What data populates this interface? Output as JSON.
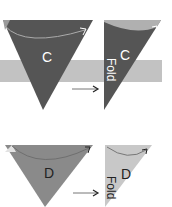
{
  "diagram": {
    "step_c": {
      "label": "C",
      "fold_label": "Fold",
      "colors": {
        "dark": "#555555",
        "band": "#c2c2c2",
        "flap": "#aaaaaa",
        "text": "#ffffff"
      }
    },
    "step_d": {
      "label": "D",
      "fold_label": "Fold",
      "colors": {
        "mid": "#8a8a8a",
        "light": "#c8c8c8",
        "corner": "#e2e2e2",
        "text": "#222222"
      }
    },
    "arrow_icon": "right-arrow-icon"
  }
}
